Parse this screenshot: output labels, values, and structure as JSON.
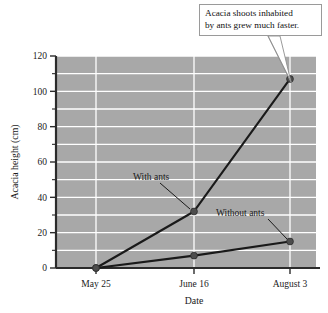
{
  "chart_data": {
    "type": "line",
    "title": "",
    "xlabel": "Date",
    "ylabel": "Acacia height  (cm)",
    "categories": [
      "May 25",
      "June 16",
      "August 3"
    ],
    "series": [
      {
        "name": "With ants",
        "values": [
          0,
          32,
          107
        ]
      },
      {
        "name": "Without ants",
        "values": [
          0,
          7,
          15
        ]
      }
    ],
    "ylim": [
      0,
      120
    ],
    "yticks": [
      0,
      20,
      40,
      60,
      80,
      100,
      120
    ],
    "ytick_labels": [
      "0",
      "20",
      "40",
      "60",
      "80",
      "100",
      "120"
    ],
    "yminor_step": 10,
    "grid": "horizontal-and-vertical-white-on-gray",
    "legend": "inline-annotations",
    "plot_background": "#a8a8a8",
    "gridline_color": "#ffffff",
    "line_color": "#1a1a1a",
    "marker_color": "#4d4d4d"
  },
  "annotations": {
    "callout": {
      "line1": "Acacia shoots inhabited",
      "line2": "by ants grew much faster.",
      "points_to": "August 3 with-ants data point"
    },
    "series_labels": [
      {
        "text": "With ants",
        "points_to": "June 16 with-ants data point"
      },
      {
        "text": "Without ants",
        "points_to": "August 3 without-ants data point"
      }
    ]
  },
  "axes": {
    "y_title": "Acacia height  (cm)",
    "x_title": "Date",
    "y_tick_labels": [
      "120",
      "100",
      "80",
      "60",
      "40",
      "20",
      "0"
    ],
    "x_tick_labels": [
      "May 25",
      "June 16",
      "August 3"
    ]
  }
}
